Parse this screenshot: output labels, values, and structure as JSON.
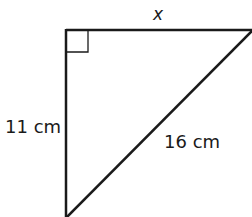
{
  "figure": {
    "type": "right-triangle",
    "stroke_color": "#1a1a1a",
    "labels": {
      "top_side": "x",
      "left_side": "11 cm",
      "hypotenuse": "16 cm"
    },
    "right_angle_marker": true
  }
}
